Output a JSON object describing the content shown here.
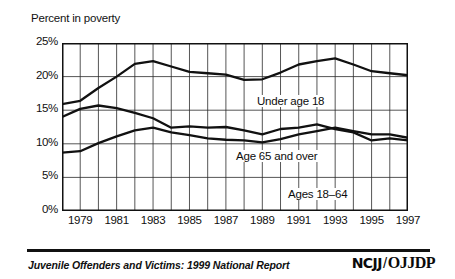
{
  "figure": {
    "axis_title": "Percent in poverty",
    "footer_caption": "Juvenile Offenders and Victims: 1999 National Report",
    "logo": {
      "left": "NCJJ",
      "separator": "/",
      "right": "OJJDP"
    }
  },
  "chart_data": {
    "type": "line",
    "title": "Percent in poverty",
    "xlabel": "",
    "ylabel": "Percent in poverty",
    "xlim": [
      1978,
      1997
    ],
    "ylim": [
      0,
      25
    ],
    "yticks": [
      "0%",
      "5%",
      "10%",
      "15%",
      "20%",
      "25%"
    ],
    "ytick_values": [
      0,
      5,
      10,
      15,
      20,
      25
    ],
    "xticks": [
      "1979",
      "1981",
      "1983",
      "1985",
      "1987",
      "1989",
      "1991",
      "1993",
      "1995",
      "1997"
    ],
    "xtick_values": [
      1979,
      1981,
      1983,
      1985,
      1987,
      1989,
      1991,
      1993,
      1995,
      1997
    ],
    "grid": true,
    "legend": "inline-annotations",
    "x": [
      1978,
      1979,
      1980,
      1981,
      1982,
      1983,
      1984,
      1985,
      1986,
      1987,
      1988,
      1989,
      1990,
      1991,
      1992,
      1993,
      1994,
      1995,
      1996,
      1997
    ],
    "series": [
      {
        "name": "Under age 18",
        "label": "Under age 18",
        "color": "#111111",
        "values": [
          15.9,
          16.4,
          18.3,
          20.0,
          21.9,
          22.3,
          21.5,
          20.7,
          20.5,
          20.3,
          19.5,
          19.6,
          20.6,
          21.8,
          22.3,
          22.7,
          21.8,
          20.8,
          20.5,
          20.2
        ]
      },
      {
        "name": "Age 65 and over",
        "label": "Age 65 and over",
        "color": "#111111",
        "values": [
          14.0,
          15.2,
          15.7,
          15.3,
          14.6,
          13.8,
          12.4,
          12.6,
          12.4,
          12.5,
          12.0,
          11.4,
          12.2,
          12.4,
          12.9,
          12.2,
          11.7,
          10.5,
          10.8,
          10.5
        ]
      },
      {
        "name": "Ages 18-64",
        "label": "Ages 18–64",
        "color": "#111111",
        "values": [
          8.7,
          8.9,
          10.1,
          11.1,
          12.0,
          12.4,
          11.7,
          11.3,
          10.8,
          10.6,
          10.5,
          10.2,
          10.7,
          11.4,
          11.9,
          12.4,
          11.9,
          11.4,
          11.4,
          10.9
        ]
      }
    ],
    "annotations": [
      {
        "text": "Under age 18",
        "x": 1988,
        "y": 22.0
      },
      {
        "text": "Age 65 and over",
        "x": 1987,
        "y": 14.1
      },
      {
        "text": "Ages 18–64",
        "x": 1990,
        "y": 8.6
      }
    ]
  }
}
